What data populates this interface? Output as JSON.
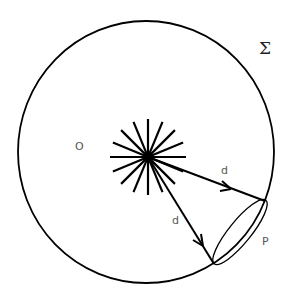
{
  "diagram": {
    "type": "geometry",
    "labels": {
      "surface": "Σ",
      "origin": "O",
      "distance_upper": "d",
      "distance_lower": "d",
      "patch": "P"
    },
    "colors": {
      "stroke": "#000000",
      "label": "#555555",
      "background": "#ffffff"
    },
    "geometry": {
      "surface_circle": {
        "cx": 146,
        "cy": 152,
        "rx": 128,
        "ry": 131
      },
      "source_center": {
        "x": 148,
        "y": 157
      },
      "source_ray_count": 16,
      "source_ray_length": 38,
      "arrows": [
        {
          "from": [
            148,
            157
          ],
          "to": [
            265,
            201
          ]
        },
        {
          "from": [
            148,
            157
          ],
          "to": [
            214,
            264
          ]
        }
      ],
      "patch_ellipse": {
        "cx": 240,
        "cy": 232,
        "rx": 41,
        "ry": 11,
        "rotate": -51
      }
    }
  }
}
